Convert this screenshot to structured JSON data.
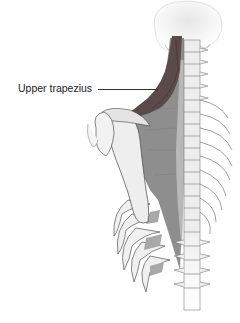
{
  "figure": {
    "labels": [
      {
        "id": "upper-trapezius",
        "text": "Upper trapezius"
      }
    ],
    "colors": {
      "upper_trapezius": "#5a4a4a",
      "trapezius": "#8e8e8e",
      "trapezius_light": "#b8b8b8",
      "bone": "#f0f0f0",
      "bone_outline": "#555555",
      "intercostal": "#a8a8a8"
    }
  }
}
